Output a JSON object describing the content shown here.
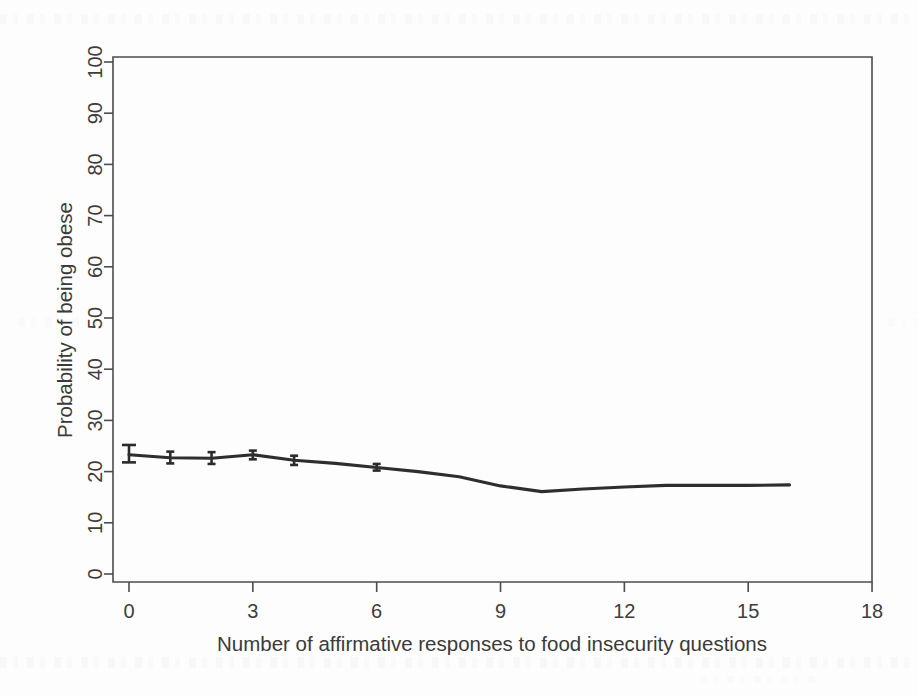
{
  "figure": {
    "kind": "scientific-figure-scan",
    "background_color": "#fdfdfd",
    "ink_color": "#2e2e2e",
    "axis_color": "#4c4c4c"
  },
  "chart_data": {
    "type": "line",
    "title": "",
    "subtitle": "",
    "xlabel": "Number of affirmative responses to food insecurity questions",
    "ylabel": "Probability of being obese",
    "xlim": [
      0,
      18
    ],
    "ylim": [
      0,
      100
    ],
    "xticks": [
      0,
      3,
      6,
      9,
      12,
      15,
      18
    ],
    "xtick_labels": [
      "0",
      "3",
      "6",
      "9",
      "12",
      "15",
      "18"
    ],
    "yticks": [
      0,
      10,
      20,
      30,
      40,
      50,
      60,
      70,
      80,
      90,
      100
    ],
    "ytick_labels": [
      "0",
      "10",
      "20",
      "30",
      "40",
      "50",
      "60",
      "70",
      "80",
      "90",
      "100"
    ],
    "grid": false,
    "legend": null,
    "legend_position": "none",
    "x": [
      0,
      1,
      2,
      3,
      4,
      5,
      6,
      7,
      8,
      9,
      10,
      11,
      12,
      13,
      14,
      15,
      16
    ],
    "values": [
      23.3,
      22.7,
      22.6,
      23.3,
      22.2,
      21.6,
      20.8,
      20.0,
      19.0,
      17.2,
      16.1,
      16.6,
      17.0,
      17.3,
      17.3,
      17.3,
      17.4
    ],
    "series": [
      {
        "name": "Predicted probability of being obese",
        "values": [
          23.3,
          22.7,
          22.6,
          23.3,
          22.2,
          21.6,
          20.8,
          20.0,
          19.0,
          17.2,
          16.1,
          16.6,
          17.0,
          17.3,
          17.3,
          17.3,
          17.4
        ]
      }
    ],
    "error_bars": [
      {
        "x": 0,
        "y": 23.3,
        "low": 21.8,
        "high": 25.2
      },
      {
        "x": 1,
        "y": 22.7,
        "low": 21.6,
        "high": 23.9
      },
      {
        "x": 2,
        "y": 22.6,
        "low": 21.5,
        "high": 23.8
      },
      {
        "x": 3,
        "y": 23.3,
        "low": 22.4,
        "high": 24.1
      },
      {
        "x": 4,
        "y": 22.2,
        "low": 21.3,
        "high": 23.1
      },
      {
        "x": 6,
        "y": 20.8,
        "low": 20.2,
        "high": 21.5
      }
    ]
  },
  "axes": {
    "y_axis_label": "Probability of being obese",
    "x_axis_label": "Number of affirmative responses to food insecurity questions"
  }
}
